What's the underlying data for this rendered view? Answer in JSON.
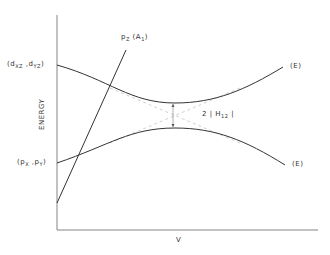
{
  "diagram": {
    "y_axis_label": "ENERGY",
    "x_axis_label": "V",
    "labels": {
      "upper_left_open": "(d",
      "upper_left_sub1": "XZ",
      "upper_left_mid": " ,d",
      "upper_left_sub2": "YZ",
      "upper_left_close": ")",
      "lower_left_open": "(p",
      "lower_left_sub1": "X",
      "lower_left_mid": " ,p",
      "lower_left_sub2": "Y",
      "lower_left_close": ")",
      "pz_main": "p",
      "pz_sub": "Z",
      "pz_sym_open": " (A",
      "pz_sym_sub": "1",
      "pz_sym_close": ")",
      "upper_right": "(E)",
      "lower_right": "(E)",
      "gap_prefix": "2 | H",
      "gap_sub": "12",
      "gap_suffix": " |"
    },
    "colors": {
      "line": "#333333",
      "dashed": "#bbbbbb",
      "axis": "#555555"
    }
  }
}
